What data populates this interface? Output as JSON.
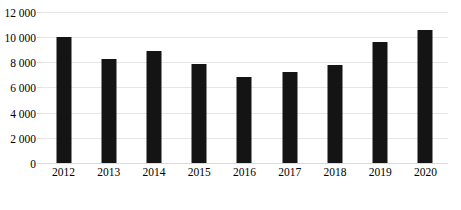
{
  "chart_data": {
    "type": "bar",
    "title": "",
    "subtitle": "",
    "xlabel": "",
    "ylabel": "",
    "categories": [
      "2012",
      "2013",
      "2014",
      "2015",
      "2016",
      "2017",
      "2018",
      "2019",
      "2020"
    ],
    "values": [
      10000,
      8300,
      8900,
      7850,
      6800,
      7200,
      7800,
      9600,
      10600
    ],
    "series": [
      {
        "name": "",
        "values": [
          10000,
          8300,
          8900,
          7850,
          6800,
          7200,
          7800,
          9600,
          10600
        ],
        "color": "#141414"
      }
    ],
    "ylim": [
      0,
      12000
    ],
    "ytick_values": [
      0,
      2000,
      4000,
      6000,
      8000,
      10000,
      12000
    ],
    "ytick_labels": [
      "0",
      "2 000",
      "4 000",
      "6 000",
      "8 000",
      "10 000",
      "12 000"
    ],
    "grid": true,
    "grid_axis": "y",
    "legend": false,
    "legend_position": "none",
    "annotations": [],
    "colors": {
      "bar": "#141414",
      "gridline": "#e6e6e6",
      "axis": "#d9d9d9",
      "text": "#000000",
      "background": "#ffffff"
    }
  }
}
